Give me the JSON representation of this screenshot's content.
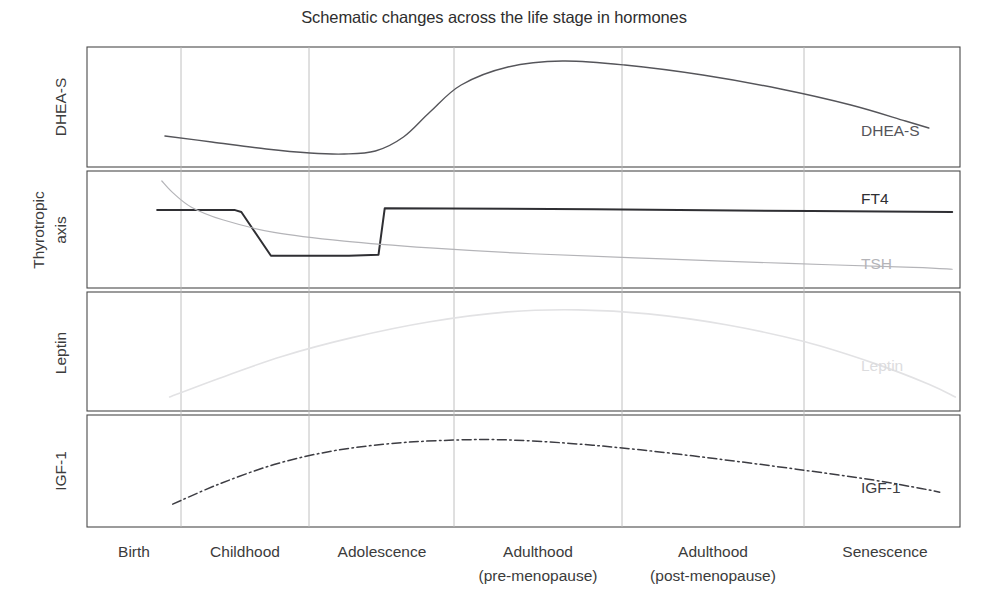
{
  "chart_data": {
    "type": "line",
    "title": "Schematic changes across the life stage in hormones",
    "xlabel": "",
    "ylabel": "",
    "grid": true,
    "legend_position": "inline-right",
    "subtitle": "",
    "annotations": [],
    "categories": [
      "Birth",
      "Childhood",
      "Adolescence",
      "Adulthood (pre-menopause)",
      "Adulthood (post-menopause)",
      "Senescence"
    ],
    "x": [
      0,
      1,
      2,
      3,
      4,
      5
    ],
    "xlim": [
      -0.25,
      5.35
    ],
    "panels": [
      {
        "name": "DHEA-S",
        "ylabel": "DHEA-S",
        "ylim": [
          0,
          1
        ],
        "series": [
          {
            "name": "DHEA-S",
            "label": "DHEA-S",
            "color": "#55555a",
            "width": 1.4,
            "dash": "none",
            "x": [
              0.25,
              0.55,
              0.9,
              1.18,
              1.4,
              1.6,
              1.78,
              1.95,
              2.15,
              2.45,
              2.8,
              3.2,
              3.7,
              4.2,
              4.65,
              5.0,
              5.15
            ],
            "values": [
              0.21,
              0.15,
              0.08,
              0.04,
              0.03,
              0.06,
              0.2,
              0.45,
              0.72,
              0.9,
              0.96,
              0.92,
              0.82,
              0.68,
              0.52,
              0.36,
              0.29
            ]
          }
        ]
      },
      {
        "name": "Thyrotropic axis",
        "ylabel": "Thyrotropic axis",
        "ylim": [
          0,
          1
        ],
        "series": [
          {
            "name": "FT4",
            "label": "FT4",
            "color": "#2f2f33",
            "width": 2.0,
            "dash": "none",
            "x": [
              0.2,
              0.7,
              0.74,
              0.93,
              1.43,
              1.62,
              1.66,
              3.0,
              4.4,
              5.3
            ],
            "values": [
              0.7,
              0.7,
              0.68,
              0.23,
              0.23,
              0.24,
              0.72,
              0.71,
              0.69,
              0.68
            ]
          },
          {
            "name": "TSH",
            "label": "TSH",
            "color": "#b4b4b8",
            "width": 1.2,
            "dash": "none",
            "x": [
              0.23,
              0.3,
              0.42,
              0.62,
              0.95,
              1.4,
              1.95,
              2.6,
              3.4,
              4.25,
              5.05,
              5.3
            ],
            "values": [
              1.0,
              0.88,
              0.73,
              0.6,
              0.47,
              0.38,
              0.31,
              0.25,
              0.2,
              0.15,
              0.11,
              0.09
            ]
          }
        ]
      },
      {
        "name": "Leptin",
        "ylabel": "Leptin",
        "ylim": [
          0,
          1
        ],
        "series": [
          {
            "name": "Leptin",
            "label": "Leptin",
            "color": "#e2e2e4",
            "width": 1.6,
            "dash": "none",
            "x": [
              0.28,
              0.6,
              1.0,
              1.45,
              1.95,
              2.45,
              2.9,
              3.35,
              3.85,
              4.35,
              4.8,
              5.15,
              5.32
            ],
            "values": [
              0.04,
              0.23,
              0.45,
              0.64,
              0.8,
              0.9,
              0.92,
              0.88,
              0.77,
              0.6,
              0.38,
              0.17,
              0.04
            ]
          }
        ]
      },
      {
        "name": "IGF-1",
        "ylabel": "IGF-1",
        "ylim": [
          0,
          1
        ],
        "series": [
          {
            "name": "IGF-1",
            "label": "IGF-1",
            "color": "#3c3c42",
            "width": 1.5,
            "dash": "dash-dot",
            "x": [
              0.3,
              0.6,
              0.95,
              1.3,
              1.65,
              2.0,
              2.4,
              2.85,
              3.3,
              3.8,
              4.3,
              4.8,
              5.1,
              5.22
            ],
            "values": [
              0.14,
              0.36,
              0.57,
              0.71,
              0.79,
              0.83,
              0.84,
              0.8,
              0.73,
              0.63,
              0.52,
              0.4,
              0.31,
              0.27
            ]
          }
        ]
      }
    ]
  },
  "labels": {
    "series_dhea": "DHEA-S",
    "series_ft4": "FT4",
    "series_tsh": "TSH",
    "series_leptin": "Leptin",
    "series_igf1": "IGF-1",
    "axis_dhea": "DHEA-S",
    "axis_thyro_line1": "Thyrotropic",
    "axis_thyro_line2": "axis",
    "axis_leptin": "Leptin",
    "axis_igf1": "IGF-1",
    "tick_birth": "Birth",
    "tick_childhood": "Childhood",
    "tick_adolescence": "Adolescence",
    "tick_adulthood_pre_1": "Adulthood",
    "tick_adulthood_pre_2": "(pre-menopause)",
    "tick_adulthood_post_1": "Adulthood",
    "tick_adulthood_post_2": "(post-menopause)",
    "tick_senescence": "Senescence"
  },
  "colors": {
    "frame": "#4a4a4a",
    "grid": "#b9b9b9",
    "dhea": "#55555a",
    "ft4": "#2f2f33",
    "tsh": "#b4b4b8",
    "leptin": "#e2e2e4",
    "igf1": "#3c3c42",
    "text": "#3b3b3b",
    "background": "#ffffff"
  }
}
